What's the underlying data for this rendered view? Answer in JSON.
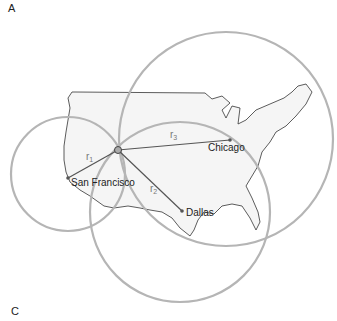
{
  "panels": {
    "top_label": "A",
    "bottom_label": "C"
  },
  "cities": [
    {
      "name": "San Francisco",
      "x": 68,
      "y": 178
    },
    {
      "name": "Dallas",
      "x": 182,
      "y": 211
    },
    {
      "name": "Chicago",
      "x": 230,
      "y": 140
    }
  ],
  "receiver": {
    "x": 118,
    "y": 150
  },
  "radii": [
    {
      "label": "r",
      "sub": "1"
    },
    {
      "label": "r",
      "sub": "2"
    },
    {
      "label": "r",
      "sub": "3"
    }
  ],
  "colors": {
    "circle": "#b5b5b5",
    "map_fill": "#f4f4f4",
    "map_stroke": "#333333",
    "line": "#555555"
  }
}
